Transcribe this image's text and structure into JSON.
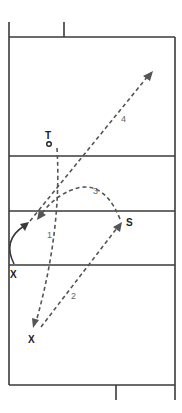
{
  "diagram": {
    "type": "volleyball-court-play-diagram",
    "colors": {
      "court_line": "#3a3a3a",
      "dashed_path": "#555555",
      "label": "#222222",
      "sequence_label": "#666666"
    },
    "players": [
      {
        "id": "target",
        "label": "T",
        "marker": "circle"
      },
      {
        "id": "setter",
        "label": "S"
      },
      {
        "id": "player-net",
        "label": "X"
      },
      {
        "id": "player-back",
        "label": "X"
      }
    ],
    "sequence_labels": [
      {
        "id": "seq-1",
        "text": "1"
      },
      {
        "id": "seq-2",
        "text": "2"
      },
      {
        "id": "seq-3",
        "text": "3"
      },
      {
        "id": "seq-4",
        "text": "4"
      }
    ],
    "paths": [
      {
        "id": "path-1",
        "label": "1",
        "style": "dashed",
        "from": "T",
        "to": "back X"
      },
      {
        "id": "path-2",
        "label": "2",
        "style": "dashed",
        "from": "back X",
        "to": "S"
      },
      {
        "id": "path-3",
        "label": "3",
        "style": "dashed-arc",
        "from": "S",
        "to": "left front"
      },
      {
        "id": "path-4",
        "label": "4",
        "style": "dashed",
        "from": "left front",
        "to": "upper right"
      },
      {
        "id": "path-move",
        "label": "",
        "style": "solid-curve",
        "from": "net X",
        "to": "left front"
      }
    ]
  }
}
